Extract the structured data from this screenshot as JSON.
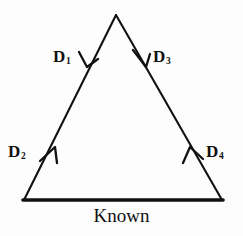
{
  "figure": {
    "background_color": "#fdfdfd",
    "ink_color": "#111111",
    "base_label": "Known",
    "labels": [
      {
        "id": "D1",
        "text": "D",
        "subscript": "1",
        "edge": "left",
        "direction": "down"
      },
      {
        "id": "D2",
        "text": "D",
        "subscript": "2",
        "edge": "left",
        "direction": "up"
      },
      {
        "id": "D3",
        "text": "D",
        "subscript": "3",
        "edge": "right",
        "direction": "down"
      },
      {
        "id": "D4",
        "text": "D",
        "subscript": "4",
        "edge": "right",
        "direction": "up"
      }
    ],
    "geometry": {
      "apex": [
        116,
        15
      ],
      "bottom_left": [
        24,
        200
      ],
      "bottom_right": [
        222,
        200
      ]
    }
  }
}
